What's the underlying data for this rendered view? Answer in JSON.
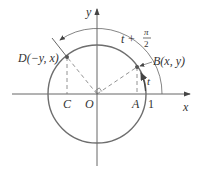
{
  "diagram": {
    "type": "unit-circle",
    "colors": {
      "axis": "#555555",
      "circle": "#6e6e6e",
      "dashed": "#777777",
      "point": "#555555",
      "text": "#333333"
    },
    "axes": {
      "x_label": "x",
      "y_label": "y",
      "origin_label": "O"
    },
    "points": {
      "B": {
        "label": "B(x, y)"
      },
      "D": {
        "label": "D(−y, x)"
      },
      "A": {
        "label": "A"
      },
      "C": {
        "label": "C"
      },
      "one": {
        "label": "1"
      }
    },
    "arcs": {
      "inner": {
        "label": "t"
      },
      "outer": {
        "label_t": "t +",
        "label_num": "π",
        "label_den": "2"
      }
    }
  }
}
